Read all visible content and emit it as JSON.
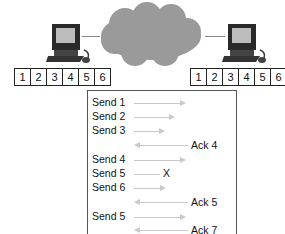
{
  "diagram": {
    "sender": {
      "icon": "computer-icon",
      "segments": [
        "1",
        "2",
        "3",
        "4",
        "5",
        "6"
      ]
    },
    "receiver": {
      "icon": "computer-icon",
      "segments": [
        "1",
        "2",
        "3",
        "4",
        "5",
        "6"
      ]
    },
    "network": {
      "icon": "cloud-icon"
    },
    "sequence": [
      {
        "label": "Send 1",
        "dir": "right"
      },
      {
        "label": "Send 2",
        "dir": "right"
      },
      {
        "label": "Send 3",
        "dir": "right"
      },
      {
        "label": "Ack 4",
        "dir": "left"
      },
      {
        "label": "Send 4",
        "dir": "right"
      },
      {
        "label": "Send 5",
        "dir": "lost",
        "marker": "X"
      },
      {
        "label": "Send 6",
        "dir": "right"
      },
      {
        "label": "Ack 5",
        "dir": "left"
      },
      {
        "label": "Send 5",
        "dir": "right"
      },
      {
        "label": "Ack 7",
        "dir": "left"
      }
    ]
  }
}
